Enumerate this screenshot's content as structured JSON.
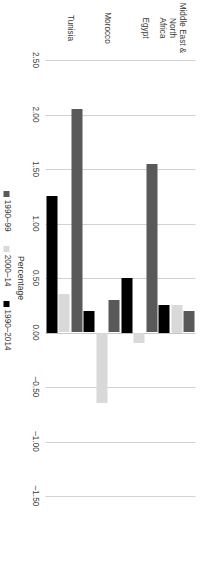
{
  "chart_data": {
    "type": "bar",
    "orientation": "horizontal",
    "title": "",
    "xlabel": "Percentage",
    "ylabel": "",
    "categories": [
      "Middle East & North\nAfrica",
      "Egypt",
      "Morocco",
      "Tunisia"
    ],
    "series": [
      {
        "name": "1990–99",
        "color": "#595959",
        "values": [
          0.2,
          1.55,
          0.3,
          2.05
        ]
      },
      {
        "name": "2000–14",
        "color": "#D9D9D9",
        "values": [
          0.25,
          -0.1,
          -0.65,
          0.35
        ]
      },
      {
        "name": "1990–2014",
        "color": "#000000",
        "values": [
          0.25,
          0.5,
          0.2,
          1.25
        ]
      }
    ],
    "axis": {
      "ticks": [
        "2.50",
        "2.00",
        "1.50",
        "1.00",
        "0.50",
        "0.00",
        "–0.50",
        "–1.00",
        "–1.50"
      ],
      "tick_values": [
        2.5,
        2.0,
        1.5,
        1.0,
        0.5,
        0.0,
        -0.5,
        -1.0,
        -1.5
      ],
      "min": -1.5,
      "max": 2.5,
      "reversed": true,
      "grid": true
    },
    "legend": {
      "position": "bottom",
      "entries": [
        "1990–99",
        "2000–14",
        "1990–2014"
      ]
    }
  },
  "axis_title": {
    "text": "Percentage"
  },
  "ticks": [
    {
      "label": "2.50"
    },
    {
      "label": "2.00"
    },
    {
      "label": "1.50"
    },
    {
      "label": "1.00"
    },
    {
      "label": "0.50"
    },
    {
      "label": "0.00"
    },
    {
      "label": "–0.50"
    },
    {
      "label": "–1.00"
    },
    {
      "label": "–1.50"
    }
  ],
  "categories": [
    {
      "label": "Middle East & North\nAfrica"
    },
    {
      "label": "Egypt"
    },
    {
      "label": "Morocco"
    },
    {
      "label": "Tunisia"
    }
  ],
  "legend": [
    {
      "label": "1990–99"
    },
    {
      "label": "2000–14"
    },
    {
      "label": "1990–2014"
    }
  ]
}
